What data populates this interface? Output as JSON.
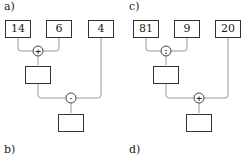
{
  "panels": [
    {
      "label": "a)",
      "inputs": [
        "14",
        "6",
        "4"
      ],
      "op1": "+",
      "op2": "·",
      "result_mid": "",
      "result_final": ""
    },
    {
      "label": "c)",
      "inputs": [
        "81",
        "9",
        "20"
      ],
      "op1": ":",
      "op2": "+",
      "result_mid": "",
      "result_final": ""
    }
  ],
  "bottom_labels": [
    "b)",
    "d)"
  ]
}
